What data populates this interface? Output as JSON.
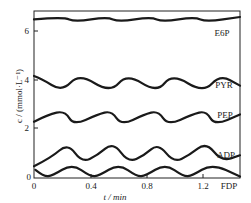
{
  "chart_data": {
    "type": "line",
    "title": "",
    "xlabel": "t / min",
    "ylabel": "c / (mmol·L⁻¹)",
    "xlim": [
      0,
      1.46
    ],
    "ylim": [
      0,
      6.9
    ],
    "grid": false,
    "legend": "inline labels at right",
    "x_ticks": [
      0,
      0.4,
      0.8,
      1.2
    ],
    "x_tick_labels": [
      "0",
      "0.4",
      "0.8",
      "1.2"
    ],
    "y_ticks": [
      0,
      2,
      4,
      6
    ],
    "y_tick_labels": [
      "0",
      "2",
      "4",
      "6"
    ],
    "series": [
      {
        "name": "E6P",
        "x": [
          0,
          0.21,
          0.29,
          0.52,
          0.6,
          0.83,
          0.91,
          1.14,
          1.22,
          1.46
        ],
        "values": [
          6.55,
          6.65,
          6.45,
          6.65,
          6.45,
          6.65,
          6.45,
          6.65,
          6.45,
          6.65
        ]
      },
      {
        "name": "PYR",
        "x": [
          0,
          0.05,
          0.2,
          0.32,
          0.54,
          0.66,
          0.87,
          0.98,
          1.2,
          1.32,
          1.46
        ],
        "values": [
          4.2,
          4.1,
          3.55,
          4.3,
          3.5,
          4.3,
          3.5,
          4.3,
          3.5,
          4.25,
          3.8
        ]
      },
      {
        "name": "PEP",
        "x": [
          0,
          0.1,
          0.22,
          0.28,
          0.45,
          0.55,
          0.62,
          0.78,
          0.88,
          0.95,
          1.12,
          1.22,
          1.28,
          1.46
        ],
        "values": [
          2.3,
          2.6,
          2.75,
          2.15,
          2.6,
          2.75,
          2.15,
          2.6,
          2.75,
          2.15,
          2.6,
          2.75,
          2.15,
          2.6
        ]
      },
      {
        "name": "ADP",
        "x": [
          0,
          0.12,
          0.24,
          0.34,
          0.45,
          0.56,
          0.67,
          0.78,
          0.88,
          0.99,
          1.1,
          1.22,
          1.33,
          1.46
        ],
        "values": [
          0.45,
          0.8,
          1.4,
          0.6,
          0.9,
          1.45,
          0.6,
          0.9,
          1.4,
          0.6,
          0.9,
          1.45,
          0.65,
          0.9
        ]
      },
      {
        "name": "FDP",
        "x": [
          0.01,
          0.07,
          0.13,
          0.27,
          0.4,
          0.46,
          0.6,
          0.73,
          0.79,
          0.93,
          1.06,
          1.12,
          1.26,
          1.46
        ],
        "values": [
          0.3,
          0.02,
          0.05,
          0.55,
          0.02,
          0.05,
          0.55,
          0.02,
          0.05,
          0.55,
          0.02,
          0.05,
          0.55,
          0.02
        ]
      }
    ]
  },
  "labels": {
    "ylabel": "c / (mmol·L⁻¹)",
    "xlabel": "t / min",
    "series_e6p": "E6P",
    "series_pyr": "PYR",
    "series_pep": "PEP",
    "series_adp": "ADP",
    "series_fdp": "FDP",
    "xtick_0": "0",
    "xtick_1": "0.4",
    "xtick_2": "0.8",
    "xtick_3": "1.2",
    "ytick_0": "0",
    "ytick_1": "2",
    "ytick_2": "4",
    "ytick_3": "6"
  }
}
